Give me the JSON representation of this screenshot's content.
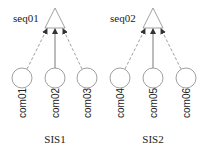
{
  "diagram": {
    "groups": [
      {
        "name": "SIS1",
        "sequence": "seq01",
        "components": [
          "com01",
          "com02",
          "com03"
        ]
      },
      {
        "name": "SIS2",
        "sequence": "seq02",
        "components": [
          "com04",
          "com05",
          "com06"
        ]
      }
    ],
    "edge_styles": {
      "outer": "dashed",
      "center": "solid"
    },
    "colors": {
      "stroke": "#888888",
      "text": "#222222"
    }
  }
}
